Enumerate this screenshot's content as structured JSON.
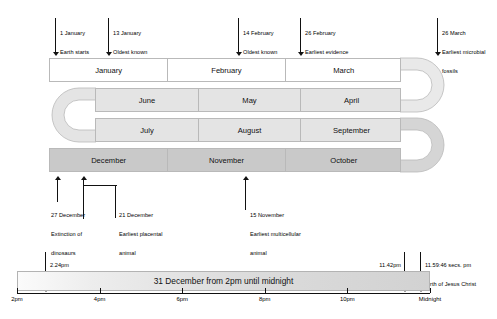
{
  "calendar": {
    "rows": [
      {
        "id": "row-1",
        "shade": "white",
        "months": [
          "January",
          "February",
          "March"
        ]
      },
      {
        "id": "row-2",
        "shade": "lgray",
        "months": [
          "June",
          "May",
          "April"
        ]
      },
      {
        "id": "row-3",
        "shade": "lgray",
        "months": [
          "July",
          "August",
          "September"
        ]
      },
      {
        "id": "row-4",
        "shade": "dgray",
        "months": [
          "December",
          "November",
          "October"
        ]
      }
    ]
  },
  "top_events": [
    {
      "date": "1 January",
      "line2": "Earth starts",
      "line3": "forming"
    },
    {
      "date": "13 January",
      "line2": "Oldest known",
      "line3": "mineral"
    },
    {
      "date": "14 February",
      "line2": "Oldest known",
      "line3": "rock"
    },
    {
      "date": "26 February",
      "line2": "Earliest evidence",
      "line3": "of life"
    },
    {
      "date": "26 March",
      "line2": "Earliest microbial",
      "line3": "fossils"
    }
  ],
  "bottom_events": [
    {
      "date": "27 December",
      "line2": "Extinction of",
      "line3": "dinosaurs"
    },
    {
      "date": "21 December",
      "line2": "Earliest placental",
      "line3": "animal"
    },
    {
      "date": "15 November",
      "line2": "Earliest multicellular",
      "line3": "animal"
    }
  ],
  "timeline": {
    "bar_label": "31 December from 2pm until midnight",
    "ticks": [
      "2pm",
      "4pm",
      "6pm",
      "8pm",
      "10pm",
      "Midnight"
    ],
    "events": [
      {
        "time": "2.24pm",
        "desc": "Earliest hominid",
        "align": "left"
      },
      {
        "time": "11.42pm",
        "desc": "Earliest modern homo sapiens",
        "align": "right"
      },
      {
        "time": "11.59:46 secs. pm",
        "desc": "Birth of Jesus Christ",
        "align": "left"
      }
    ]
  },
  "colors": {
    "row_white": "#ffffff",
    "row_light_gray": "#e4e4e4",
    "row_dark_gray": "#c9c9c9",
    "outline": "#b9b9b9",
    "ink": "#111111"
  }
}
